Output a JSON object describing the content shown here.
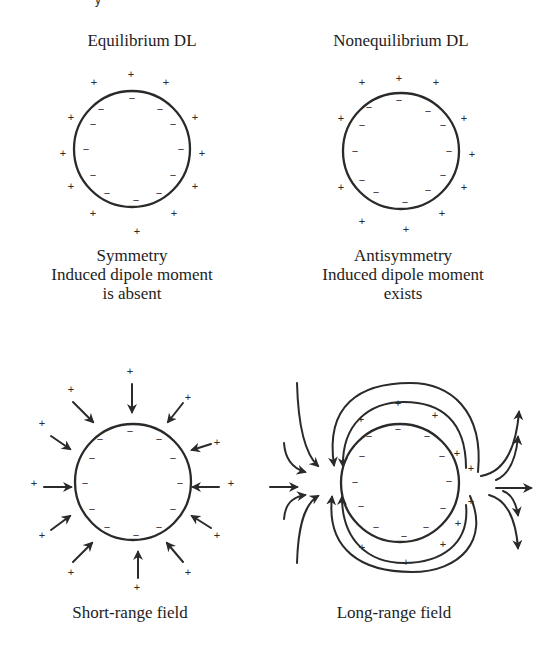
{
  "figure": {
    "top_fragment": "y",
    "panels": [
      {
        "id": "equilibrium",
        "title": "Equilibrium DL",
        "caption_lines": [
          "Symmetry",
          "Induced dipole moment",
          "is absent"
        ]
      },
      {
        "id": "nonequilibrium",
        "title": "Nonequilibrium DL",
        "caption_lines": [
          "Antisymmetry",
          "Induced dipole moment",
          "exists"
        ]
      },
      {
        "id": "short-range",
        "caption": "Short-range field"
      },
      {
        "id": "long-range",
        "caption": "Long-range field"
      }
    ],
    "symbols": {
      "plus": "+",
      "minus": "−"
    },
    "colors": {
      "ink": "#2a2a2a",
      "background": "#ffffff"
    }
  }
}
